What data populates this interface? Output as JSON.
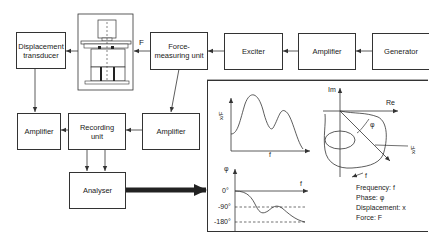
{
  "blocks": {
    "displacement_transducer": "Displacement\ntransducer",
    "force_measuring_unit": "Force-\nmeasuring unit",
    "exciter": "Exciter",
    "amplifier_top": "Amplifier",
    "generator": "Generator",
    "amplifier_left": "Amplifier",
    "recording_unit": "Recording\nunit",
    "amplifier_right": "Amplifier",
    "analyser": "Analyser"
  },
  "labels": {
    "force": "F"
  },
  "results": {
    "magnitude_plot": {
      "ylabel": "x/F",
      "xlabel": "f"
    },
    "phase_plot": {
      "ylabel": "φ",
      "xlabel": "f",
      "ticks": [
        "0°",
        "-90°",
        "-180°"
      ]
    },
    "polar_plot": {
      "im_label": "Im",
      "re_label": "Re",
      "angle_label": "φ",
      "vector_label": "x/F",
      "direction_label": "f"
    },
    "legend": [
      "Frequency: f",
      "Phase: φ",
      "Displacement: x",
      "Force: F"
    ]
  },
  "colors": {
    "line": "#333333",
    "background": "#ffffff",
    "text": "#222222"
  }
}
